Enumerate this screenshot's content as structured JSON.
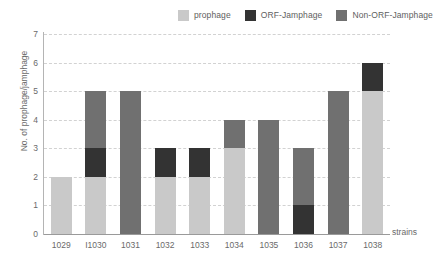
{
  "chart_data": {
    "type": "bar",
    "subtype": "stacked-vertical",
    "title": "",
    "xlabel": "strains",
    "ylabel": "No. of prophage/jamphage",
    "categories": [
      "1029",
      "I1030",
      "1031",
      "1032",
      "1033",
      "1034",
      "1035",
      "1036",
      "1037",
      "1038"
    ],
    "series": [
      {
        "name": "prophage",
        "color": "#c9c9c9",
        "values": [
          2,
          2,
          0,
          2,
          2,
          3,
          0,
          0,
          0,
          5
        ]
      },
      {
        "name": "ORF-Jamphage",
        "color": "#333333",
        "values": [
          0,
          1,
          0,
          1,
          1,
          0,
          0,
          1,
          0,
          1
        ]
      },
      {
        "name": "Non-ORF-Jamphage",
        "color": "#707070",
        "values": [
          0,
          2,
          5,
          0,
          0,
          1,
          4,
          2,
          5,
          0
        ]
      }
    ],
    "stack_order": [
      "prophage",
      "ORF-Jamphage",
      "Non-ORF-Jamphage"
    ],
    "stack_order_note": "1036 draws ORF-Jamphage at the bottom of the stack",
    "totals": [
      2,
      5,
      5,
      3,
      3,
      4,
      4,
      3,
      5,
      6
    ],
    "ylim": [
      0,
      7
    ],
    "yticks": [
      "0",
      "1",
      "2",
      "3",
      "4",
      "5",
      "6",
      "7"
    ],
    "ytick_values": [
      0,
      1,
      2,
      3,
      4,
      5,
      6,
      7
    ],
    "grid": true,
    "grid_axis": "y",
    "grid_style": "dashed",
    "grid_color": "#d2d2d2",
    "legend_position": "top-right",
    "background_color": "#ffffff",
    "axis_color": "#b4b4b4",
    "text_color": "#6a6a6a",
    "bars": [
      {
        "category": "1029",
        "total": 2,
        "segments": [
          {
            "series": "prophage",
            "value": 2,
            "from": 0,
            "to": 2
          }
        ]
      },
      {
        "category": "I1030",
        "total": 5,
        "segments": [
          {
            "series": "prophage",
            "value": 2,
            "from": 0,
            "to": 2
          },
          {
            "series": "ORF-Jamphage",
            "value": 1,
            "from": 2,
            "to": 3
          },
          {
            "series": "Non-ORF-Jamphage",
            "value": 2,
            "from": 3,
            "to": 5
          }
        ]
      },
      {
        "category": "1031",
        "total": 5,
        "segments": [
          {
            "series": "Non-ORF-Jamphage",
            "value": 5,
            "from": 0,
            "to": 5
          }
        ]
      },
      {
        "category": "1032",
        "total": 3,
        "segments": [
          {
            "series": "prophage",
            "value": 2,
            "from": 0,
            "to": 2
          },
          {
            "series": "ORF-Jamphage",
            "value": 1,
            "from": 2,
            "to": 3
          }
        ]
      },
      {
        "category": "1033",
        "total": 3,
        "segments": [
          {
            "series": "prophage",
            "value": 2,
            "from": 0,
            "to": 2
          },
          {
            "series": "ORF-Jamphage",
            "value": 1,
            "from": 2,
            "to": 3
          }
        ]
      },
      {
        "category": "1034",
        "total": 4,
        "segments": [
          {
            "series": "prophage",
            "value": 3,
            "from": 0,
            "to": 3
          },
          {
            "series": "Non-ORF-Jamphage",
            "value": 1,
            "from": 3,
            "to": 4
          }
        ]
      },
      {
        "category": "1035",
        "total": 4,
        "segments": [
          {
            "series": "Non-ORF-Jamphage",
            "value": 4,
            "from": 0,
            "to": 4
          }
        ]
      },
      {
        "category": "1036",
        "total": 3,
        "segments": [
          {
            "series": "ORF-Jamphage",
            "value": 1,
            "from": 0,
            "to": 1
          },
          {
            "series": "Non-ORF-Jamphage",
            "value": 2,
            "from": 1,
            "to": 3
          }
        ]
      },
      {
        "category": "1037",
        "total": 5,
        "segments": [
          {
            "series": "Non-ORF-Jamphage",
            "value": 5,
            "from": 0,
            "to": 5
          }
        ]
      },
      {
        "category": "1038",
        "total": 6,
        "segments": [
          {
            "series": "prophage",
            "value": 5,
            "from": 0,
            "to": 5
          },
          {
            "series": "ORF-Jamphage",
            "value": 1,
            "from": 5,
            "to": 6
          }
        ]
      }
    ]
  },
  "legend": {
    "items": [
      {
        "label": "prophage",
        "color": "#c9c9c9",
        "icon": "square-swatch-icon"
      },
      {
        "label": "ORF-Jamphage",
        "color": "#333333",
        "icon": "square-swatch-icon"
      },
      {
        "label": "Non-ORF-Jamphage",
        "color": "#707070",
        "icon": "square-swatch-icon"
      }
    ]
  }
}
